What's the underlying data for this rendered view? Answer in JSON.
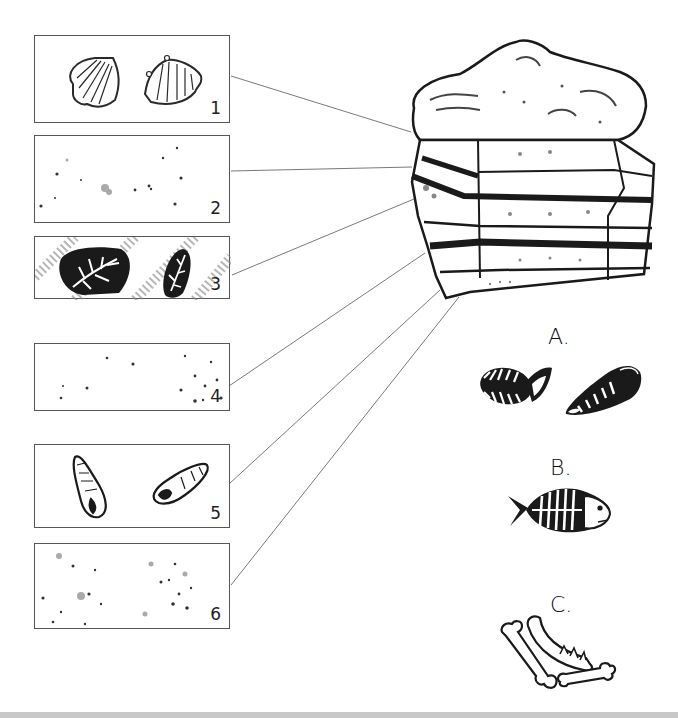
{
  "panels": [
    {
      "number": "1",
      "content": "two scallop shell fossils",
      "x": 34,
      "y": 35,
      "w": 196,
      "h": 88
    },
    {
      "number": "2",
      "content": "scattered sediment specks, no fossils",
      "x": 34,
      "y": 135,
      "w": 196,
      "h": 88
    },
    {
      "number": "3",
      "content": "two dark rocks with plant (fern) fossils on striped sediment",
      "x": 34,
      "y": 236,
      "w": 196,
      "h": 63
    },
    {
      "number": "4",
      "content": "scattered sediment specks, no fossils",
      "x": 34,
      "y": 343,
      "w": 196,
      "h": 68
    },
    {
      "number": "5",
      "content": "two spiral snail shell fossils",
      "x": 34,
      "y": 444,
      "w": 196,
      "h": 84
    },
    {
      "number": "6",
      "content": "scattered sediment specks, no fossils",
      "x": 34,
      "y": 543,
      "w": 196,
      "h": 86
    }
  ],
  "connector_lines": [
    {
      "from_panel": "1",
      "x1": 231,
      "y1": 76,
      "x2": 411,
      "y2": 132
    },
    {
      "from_panel": "2",
      "x1": 231,
      "y1": 171,
      "x2": 412,
      "y2": 167
    },
    {
      "from_panel": "3",
      "x1": 232,
      "y1": 275,
      "x2": 414,
      "y2": 199
    },
    {
      "from_panel": "4",
      "x1": 229,
      "y1": 386,
      "x2": 425,
      "y2": 253
    },
    {
      "from_panel": "5",
      "x1": 229,
      "y1": 484,
      "x2": 440,
      "y2": 290
    },
    {
      "from_panel": "6",
      "x1": 231,
      "y1": 585,
      "x2": 459,
      "y2": 297
    }
  ],
  "rock": {
    "description": "layered sedimentary rock block with six strata"
  },
  "options": [
    {
      "label": "A.",
      "content": "two trilobite fossils"
    },
    {
      "label": "B.",
      "content": "fish skeleton fossil"
    },
    {
      "label": "C.",
      "content": "bones and jawbone with teeth"
    }
  ],
  "colors": {
    "ink": "#1a1a1a",
    "line": "#7a7a7a",
    "panel_border": "#555555",
    "bottom_strip": "#c8c8c8"
  }
}
